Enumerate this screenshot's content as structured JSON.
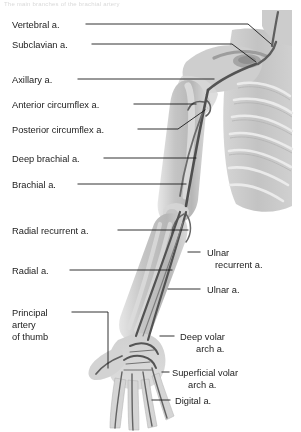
{
  "figure": {
    "caption_top": "The main branches of the brachial artery",
    "palette": {
      "background": "#ffffff",
      "text": "#1b1b1b",
      "leader_line": "#1b1b1b",
      "torso_fill": "#c8c8c8",
      "limb_fill": "#bdbdbd",
      "bone_light": "#e0e0e0",
      "artery_dark": "#4a4a4a",
      "artery_mid": "#6e6e6e"
    },
    "labels_left": [
      {
        "id": "vertebral",
        "text": "Vertebral a.",
        "x": 12,
        "y": 28,
        "leader": "M 86 24 L 248 24 L 271 44"
      },
      {
        "id": "subclavian",
        "text": "Subclavian a.",
        "x": 12,
        "y": 48,
        "leader": "M 92 44 L 232 44 L 256 62"
      },
      {
        "id": "axillary",
        "text": "Axillary a.",
        "x": 12,
        "y": 83,
        "leader": "M 78 79 L 214 79"
      },
      {
        "id": "anterior-circumflex",
        "text": "Anterior circumflex a.",
        "x": 12,
        "y": 108,
        "leader": "M 134 104 L 196 104"
      },
      {
        "id": "posterior-circumflex",
        "text": "Posterior circumflex a.",
        "x": 12,
        "y": 133,
        "leader": "M 138 129 L 178 129 L 205 110"
      },
      {
        "id": "deep-brachial",
        "text": "Deep brachial a.",
        "x": 12,
        "y": 162,
        "leader": "M 104 158 L 196 158"
      },
      {
        "id": "brachial",
        "text": "Brachial a.",
        "x": 12,
        "y": 188,
        "leader": "M 78 184 L 186 184"
      },
      {
        "id": "radial-recurrent",
        "text": "Radial recurrent a.",
        "x": 12,
        "y": 234,
        "leader": "M 118 230 L 188 230"
      },
      {
        "id": "radial",
        "text": "Radial a.",
        "x": 12,
        "y": 274,
        "leader": "M 70 270 L 172 270"
      }
    ],
    "label_thumb": {
      "id": "principal-artery-of-thumb",
      "lines": [
        "Principal",
        "artery",
        "of thumb"
      ],
      "x": 12,
      "y": 316,
      "line_height": 12,
      "leader": "M 72 312 L 108 312 L 108 368"
    },
    "labels_right": [
      {
        "id": "ulnar-recurrent",
        "lines": [
          "Ulnar",
          "recurrent a."
        ],
        "x": 207,
        "y": 256,
        "line_height": 12,
        "leader": "M 188 252 L 200 252"
      },
      {
        "id": "ulnar",
        "lines": [
          "Ulnar a."
        ],
        "x": 207,
        "y": 293,
        "line_height": 12,
        "leader": "M 168 289 L 200 289"
      },
      {
        "id": "deep-volar-arch",
        "lines": [
          "Deep volar",
          "arch a."
        ],
        "x": 180,
        "y": 340,
        "line_height": 12,
        "leader": "M 160 336 L 174 336"
      },
      {
        "id": "superficial-volar-arch",
        "lines": [
          "Superficial volar",
          "arch a."
        ],
        "x": 172,
        "y": 376,
        "line_height": 12,
        "leader": "M 162 372 L 169 372"
      },
      {
        "id": "digital",
        "lines": [
          "Digital a."
        ],
        "x": 175,
        "y": 404,
        "line_height": 12,
        "leader": "M 152 400 L 170 400"
      }
    ]
  }
}
